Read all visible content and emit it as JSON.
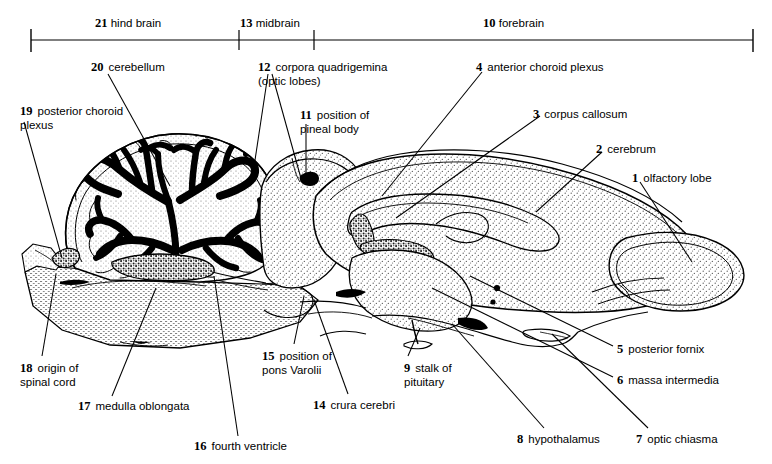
{
  "figure": {
    "width": 772,
    "height": 464,
    "ink_color": "#000000",
    "background_color": "#ffffff",
    "stipple_color": "#555555"
  },
  "scale_bar": {
    "regions": [
      {
        "number": "21",
        "label": "hind brain",
        "x_start": 31,
        "x_end": 239
      },
      {
        "number": "13",
        "label": "midbrain",
        "x_start": 239,
        "x_end": 314
      },
      {
        "number": "10",
        "label": "forebrain",
        "x_start": 314,
        "x_end": 753
      }
    ],
    "tick_positions": [
      31,
      239,
      314,
      753
    ],
    "axis_y": 40
  },
  "labels": [
    {
      "id": "1",
      "number": "1",
      "text": "olfactory lobe",
      "align": "left"
    },
    {
      "id": "2",
      "number": "2",
      "text": "cerebrum",
      "align": "left"
    },
    {
      "id": "3",
      "number": "3",
      "text": "corpus callosum",
      "align": "left"
    },
    {
      "id": "4",
      "number": "4",
      "text": "anterior choroid plexus",
      "align": "left"
    },
    {
      "id": "5",
      "number": "5",
      "text": "posterior fornix",
      "align": "left"
    },
    {
      "id": "6",
      "number": "6",
      "text": "massa intermedia",
      "align": "left"
    },
    {
      "id": "7",
      "number": "7",
      "text": "optic chiasma",
      "align": "left"
    },
    {
      "id": "8",
      "number": "8",
      "text": "hypothalamus",
      "align": "left"
    },
    {
      "id": "9",
      "number": "9",
      "text": "stalk of\npituitary",
      "align": "left"
    },
    {
      "id": "10",
      "number": "10",
      "text": "forebrain",
      "align": "left"
    },
    {
      "id": "11",
      "number": "11",
      "text": "position of\npineal body",
      "align": "left"
    },
    {
      "id": "12",
      "number": "12",
      "text": "corpora quadrigemina\n(optic lobes)",
      "align": "left"
    },
    {
      "id": "13",
      "number": "13",
      "text": "midbrain",
      "align": "left"
    },
    {
      "id": "14",
      "number": "14",
      "text": "crura cerebri",
      "align": "left"
    },
    {
      "id": "15",
      "number": "15",
      "text": "position of\npons Varolii",
      "align": "left"
    },
    {
      "id": "16",
      "number": "16",
      "text": "fourth ventricle",
      "align": "left"
    },
    {
      "id": "17",
      "number": "17",
      "text": "medulla oblongata",
      "align": "left"
    },
    {
      "id": "18",
      "number": "18",
      "text": "origin of\nspinal cord",
      "align": "left"
    },
    {
      "id": "19",
      "number": "19",
      "text": "posterior choroid\nplexus",
      "align": "left"
    },
    {
      "id": "20",
      "number": "20",
      "text": "cerebellum",
      "align": "left"
    },
    {
      "id": "21",
      "number": "21",
      "text": "hind brain",
      "align": "left"
    }
  ],
  "label_positions": {
    "l19": {
      "x": 20,
      "y": 105
    },
    "l20": {
      "x": 91,
      "y": 61
    },
    "l12": {
      "x": 258,
      "y": 61
    },
    "l11": {
      "x": 300,
      "y": 109
    },
    "l4": {
      "x": 476,
      "y": 61
    },
    "l3": {
      "x": 533,
      "y": 108
    },
    "l2": {
      "x": 596,
      "y": 143
    },
    "l1": {
      "x": 632,
      "y": 172
    },
    "l5": {
      "x": 617,
      "y": 343
    },
    "l6": {
      "x": 617,
      "y": 374
    },
    "l7": {
      "x": 636,
      "y": 433
    },
    "l8": {
      "x": 517,
      "y": 433
    },
    "l9": {
      "x": 404,
      "y": 362
    },
    "l14": {
      "x": 313,
      "y": 399
    },
    "l15": {
      "x": 262,
      "y": 350
    },
    "l16": {
      "x": 194,
      "y": 440
    },
    "l17": {
      "x": 78,
      "y": 400
    },
    "l18": {
      "x": 20,
      "y": 362
    },
    "l21": {
      "x": 95,
      "y": 18
    },
    "l13": {
      "x": 240,
      "y": 18
    },
    "l10": {
      "x": 483,
      "y": 18
    }
  },
  "leader_lines": {
    "description": "thin black pointer lines connecting each numbered caption to its structure on the section",
    "count": 21
  },
  "anatomy_regions": [
    {
      "name": "cerebellum",
      "fill": "arbor-vitae-black-white",
      "number": "20"
    },
    {
      "name": "posterior-choroid-plexus",
      "fill": "coarse-stipple",
      "number": "19"
    },
    {
      "name": "medulla-oblongata",
      "fill": "fine-horizontal-stipple",
      "number": "17"
    },
    {
      "name": "corpora-quadrigemina",
      "fill": "stipple",
      "number": "12"
    },
    {
      "name": "cerebrum",
      "fill": "stipple",
      "number": "2"
    },
    {
      "name": "corpus-callosum",
      "fill": "stipple",
      "number": "3"
    },
    {
      "name": "olfactory-lobe",
      "fill": "stipple",
      "number": "1"
    },
    {
      "name": "anterior-choroid-plexus",
      "fill": "coarse-stipple",
      "number": "4"
    },
    {
      "name": "massa-intermedia",
      "fill": "stipple",
      "number": "6"
    },
    {
      "name": "hypothalamus",
      "fill": "stipple",
      "number": "8"
    },
    {
      "name": "optic-chiasma",
      "fill": "outline",
      "number": "7"
    },
    {
      "name": "pituitary-stalk",
      "fill": "outline",
      "number": "9"
    }
  ]
}
